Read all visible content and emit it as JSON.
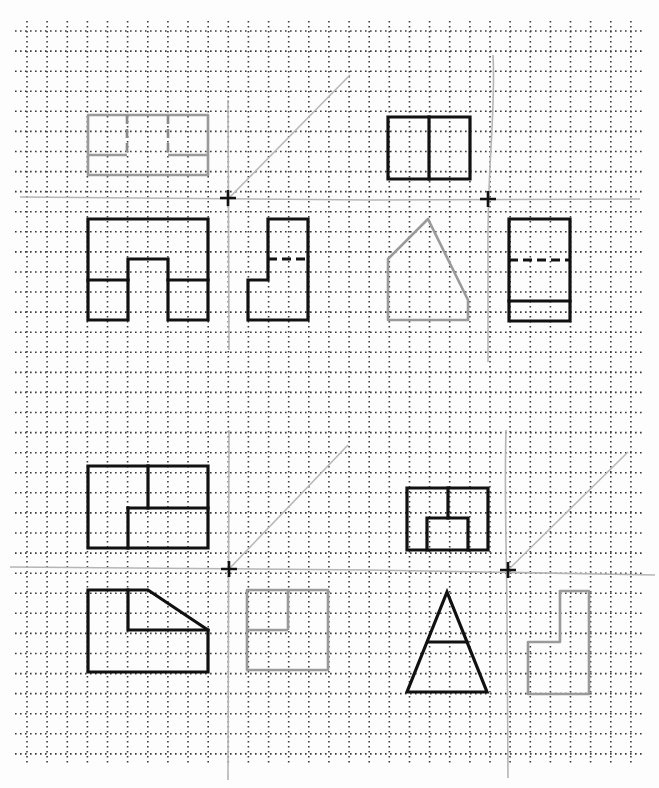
{
  "sheet": {
    "width": 659,
    "height": 788,
    "paper_color": "#fdfdfd",
    "grid": {
      "origin_x": 27,
      "origin_y": 31,
      "spacing_x": 20.13,
      "spacing_y": 20.08,
      "columns": 31,
      "rows": 37,
      "color": "#3a3a3a",
      "style": "dotted"
    }
  },
  "colors": {
    "ink": "#111111",
    "pencil": "#9a9a9a",
    "construction": "#b8b8b8"
  },
  "problems": [
    {
      "id": "problem-1",
      "views": [
        {
          "name": "top-view-pencil",
          "style": "pencil",
          "paths": [
            "M88,115 L208,115 L208,175 L88,175 Z",
            "M88,155 L127,155",
            "M168,155 L208,155"
          ],
          "dashed": [
            "M127,115 L127,155",
            "M168,115 L168,155"
          ]
        },
        {
          "name": "front-view",
          "style": "ink",
          "paths": [
            "M88,219 L208,219 L208,320 L168,320 L168,259 L128,259 L128,320 L88,320 Z",
            "M88,280 L128,280",
            "M168,280 L208,280"
          ],
          "dashed": []
        },
        {
          "name": "side-view",
          "style": "ink",
          "paths": [
            "M248,280 L268,280 L268,219 L308,219 L308,320 L248,320 Z"
          ],
          "dashed": [
            "M268,259 L308,259"
          ]
        }
      ],
      "construction": {
        "fold_h": "M20,197 L370,200",
        "fold_v": "M228,100 L229,350",
        "diagonal": "M229,198 L350,75",
        "cross": {
          "x": 228,
          "y": 198
        }
      }
    },
    {
      "id": "problem-2",
      "views": [
        {
          "name": "top-view",
          "style": "ink",
          "paths": [
            "M388,117 L470,117 L470,179 L388,179 Z",
            "M429,117 L429,179"
          ],
          "dashed": []
        },
        {
          "name": "front-view-pencil",
          "style": "pencil",
          "paths": [
            "M388,259 L428,219 L468,300 L468,320 L388,320 Z"
          ],
          "dashed": []
        },
        {
          "name": "side-view",
          "style": "ink",
          "paths": [
            "M509,219 L570,219 L570,321 L509,321 Z",
            "M509,301 L570,301"
          ],
          "dashed": [
            "M509,260 L570,260"
          ]
        }
      ],
      "construction": {
        "fold_h": "M370,200 L640,199",
        "fold_v": "M493,55 C496,110 487,170 488,250 L488,362",
        "diagonal": "",
        "cross": {
          "x": 488,
          "y": 199
        }
      }
    },
    {
      "id": "problem-3",
      "views": [
        {
          "name": "top-view",
          "style": "ink",
          "paths": [
            "M88,466 L208,466 L208,548 L88,548 Z",
            "M148,466 L148,508",
            "M128,508 L208,508",
            "M128,508 L128,548"
          ],
          "dashed": []
        },
        {
          "name": "front-view",
          "style": "ink",
          "paths": [
            "M88,590 L148,590 L208,630 L208,672 L88,672 Z",
            "M128,590 L128,630 L208,630"
          ],
          "dashed": []
        },
        {
          "name": "side-view-pencil",
          "style": "pencil",
          "paths": [
            "M247,590 L328,590 L328,670 L247,670 Z",
            "M247,630 L288,630",
            "M288,590 L288,630"
          ],
          "dashed": []
        }
      ],
      "construction": {
        "fold_h": "M10,567 L370,570",
        "fold_v": "M229,430 L228,780",
        "diagonal": "M229,569 L348,445",
        "cross": {
          "x": 229,
          "y": 569
        }
      }
    },
    {
      "id": "problem-4",
      "views": [
        {
          "name": "top-view",
          "style": "ink",
          "paths": [
            "M407,488 L488,488 L488,550 L407,550 Z",
            "M448,488 L448,518",
            "M427,550 L427,518 L468,518 L468,550"
          ],
          "dashed": []
        },
        {
          "name": "front-view",
          "style": "ink",
          "paths": [
            "M447,592 L407,692 L487,692 Z",
            "M428,642 L467,642"
          ],
          "dashed": []
        },
        {
          "name": "side-view-pencil",
          "style": "pencil",
          "paths": [
            "M528,642 L560,642 L560,591 L589,591 L589,694 L528,694 Z"
          ],
          "dashed": []
        }
      ],
      "construction": {
        "fold_h": "M370,570 L655,575",
        "fold_v": "M506,430 C504,500 507,560 507,620 L508,778",
        "diagonal": "M508,570 L628,452",
        "cross": {
          "x": 508,
          "y": 570
        }
      }
    }
  ]
}
